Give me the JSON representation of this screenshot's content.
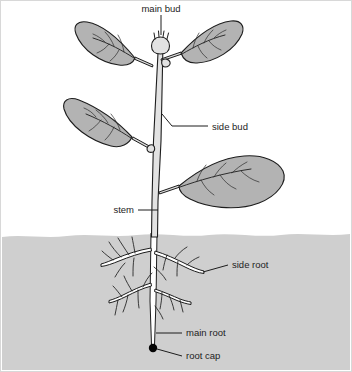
{
  "figure": {
    "type": "labelled-botanical-diagram",
    "background_color": "#ffffff",
    "border_color": "#d8d8d8"
  },
  "colors": {
    "leaf_fill": "#b3b3b3",
    "stem_fill": "#e2e2e2",
    "soil_fill": "#cfcfcf",
    "outline": "#1d1d1d",
    "root_cap": "#050505",
    "label_text": "#1d1d1d"
  },
  "labels": {
    "main_bud": "main bud",
    "side_bud": "side bud",
    "stem": "stem",
    "side_root": "side root",
    "main_root": "main root",
    "root_cap": "root cap"
  },
  "parts": [
    {
      "id": "main-bud",
      "label": "main bud",
      "region": "above-ground",
      "label_position": "top-center"
    },
    {
      "id": "side-bud",
      "label": "side bud",
      "region": "above-ground",
      "label_position": "right"
    },
    {
      "id": "stem",
      "label": "stem",
      "region": "above-ground",
      "label_position": "left"
    },
    {
      "id": "side-root",
      "label": "side root",
      "region": "below-ground",
      "label_position": "right"
    },
    {
      "id": "main-root",
      "label": "main root",
      "region": "below-ground",
      "label_position": "right"
    },
    {
      "id": "root-cap",
      "label": "root cap",
      "region": "below-ground",
      "label_position": "right"
    }
  ],
  "leaves": {
    "count": 4,
    "positions": [
      "upper-left",
      "upper-right",
      "middle-left",
      "lower-right"
    ]
  },
  "soil": {
    "surface_y": 234,
    "description": "shaded ground region below soil line"
  }
}
